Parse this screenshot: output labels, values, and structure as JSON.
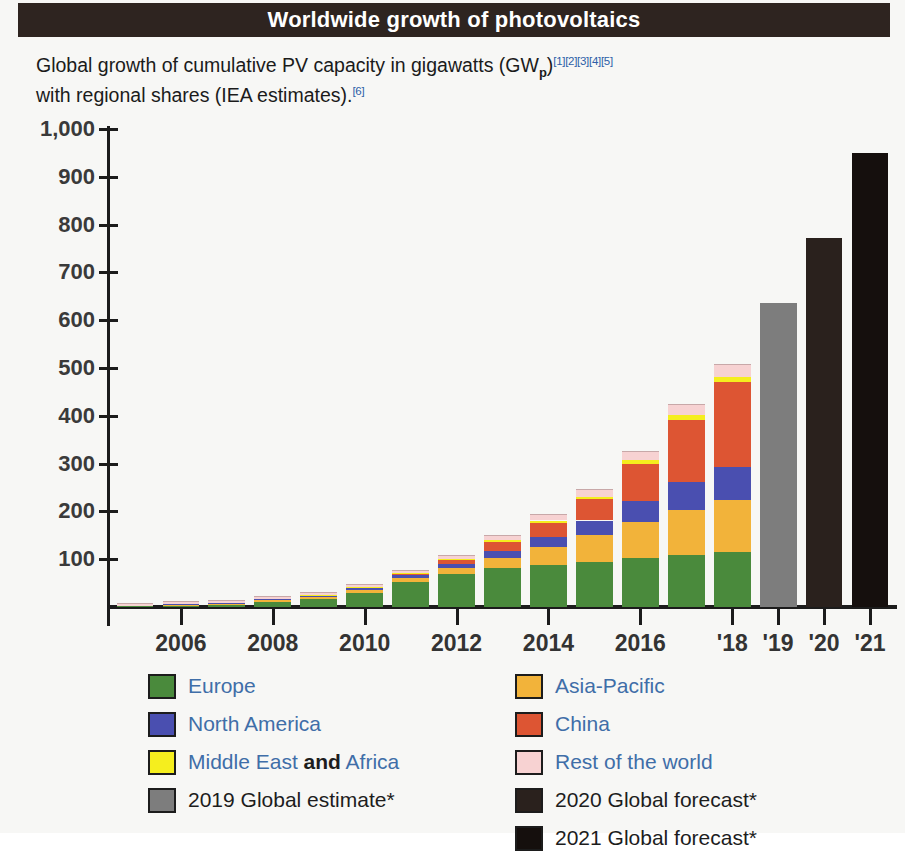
{
  "header": {
    "title": "Worldwide growth of photovoltaics"
  },
  "caption": {
    "line1_pre": "Global growth of cumulative PV capacity in gigawatts (GW",
    "line1_sub": "p",
    "line1_post": ")",
    "refs1": "[1][2][3][4][5]",
    "line2": "with regional shares (IEA estimates).",
    "refs2": "[6]"
  },
  "colors": {
    "europe": "#4a8a3c",
    "asia_pacific": "#f2b33a",
    "north_america": "#4a4fb0",
    "china": "#dd5533",
    "middle_east_africa": "#f5ee1e",
    "rest_of_world": "#f7d2d2",
    "estimate_2019": "#7d7d7d",
    "forecast_2020": "#2a211d",
    "forecast_2021": "#150f0d",
    "axis": "#1c1c1c",
    "title_bar": "#2e2420",
    "legend_text": "#3f6ea8",
    "reference_link": "#2d5fa8"
  },
  "legend": {
    "left": [
      {
        "label": "Europe",
        "color_key": "europe",
        "icon": "color-swatch",
        "dark": false
      },
      {
        "label": "North America",
        "color_key": "north_america",
        "icon": "color-swatch",
        "dark": false
      },
      {
        "label": "Middle East and Africa",
        "color_key": "middle_east_africa",
        "icon": "color-swatch",
        "dark": false,
        "mixed": true,
        "parts": [
          "Middle East ",
          "and",
          " Africa"
        ]
      },
      {
        "label": "2019 Global estimate*",
        "color_key": "estimate_2019",
        "icon": "color-swatch",
        "dark": true
      }
    ],
    "right": [
      {
        "label": "Asia-Pacific",
        "color_key": "asia_pacific",
        "icon": "color-swatch",
        "dark": false
      },
      {
        "label": "China",
        "color_key": "china",
        "icon": "color-swatch",
        "dark": false
      },
      {
        "label": "Rest of the world",
        "color_key": "rest_of_world",
        "icon": "color-swatch",
        "dark": false
      },
      {
        "label": "2020 Global forecast*",
        "color_key": "forecast_2020",
        "icon": "color-swatch",
        "dark": true
      },
      {
        "label": "2021 Global forecast*",
        "color_key": "forecast_2021",
        "icon": "color-swatch",
        "dark": true
      }
    ]
  },
  "chart_data": {
    "type": "bar",
    "stacked": true,
    "title": "Worldwide growth of photovoltaics",
    "subtitle": "Global growth of cumulative PV capacity in gigawatts (GWp) with regional shares (IEA estimates).",
    "xlabel": "",
    "ylabel": "",
    "ylim": [
      0,
      1000
    ],
    "yticks": [
      0,
      100,
      200,
      300,
      400,
      500,
      600,
      700,
      800,
      900,
      1000
    ],
    "ytick_labels": [
      "",
      "100",
      "200",
      "300",
      "400",
      "500",
      "600",
      "700",
      "800",
      "900",
      "1,000"
    ],
    "grid": false,
    "legend_position": "bottom",
    "categories": [
      "2005",
      "2006",
      "2007",
      "2008",
      "2009",
      "2010",
      "2011",
      "2012",
      "2013",
      "2014",
      "2015",
      "2016",
      "2017",
      "2018",
      "2019",
      "2020",
      "2021"
    ],
    "xtick_labels": [
      "2006",
      "2008",
      "2010",
      "2012",
      "2014",
      "2016",
      "'18",
      "'19",
      "'20",
      "'21"
    ],
    "xtick_categories": [
      "2006",
      "2008",
      "2010",
      "2012",
      "2014",
      "2016",
      "2018",
      "2019",
      "2020",
      "2021"
    ],
    "series": [
      {
        "name": "Europe",
        "color_key": "europe",
        "values": [
          2,
          3,
          5,
          11,
          16,
          30,
          52,
          70,
          81,
          88,
          95,
          102,
          108,
          115,
          0,
          0,
          0
        ]
      },
      {
        "name": "Asia-Pacific",
        "color_key": "asia_pacific",
        "values": [
          1,
          2,
          2,
          3,
          4,
          5,
          8,
          12,
          22,
          38,
          55,
          75,
          95,
          108,
          0,
          0,
          0
        ]
      },
      {
        "name": "North America",
        "color_key": "north_america",
        "values": [
          0,
          1,
          1,
          2,
          3,
          4,
          6,
          9,
          14,
          21,
          31,
          45,
          58,
          70,
          0,
          0,
          0
        ]
      },
      {
        "name": "China",
        "color_key": "china",
        "values": [
          0,
          0,
          0,
          0,
          1,
          1,
          3,
          7,
          19,
          29,
          44,
          78,
          130,
          177,
          0,
          0,
          0
        ]
      },
      {
        "name": "Middle East and Africa",
        "color_key": "middle_east_africa",
        "values": [
          0,
          0,
          0,
          1,
          1,
          2,
          2,
          3,
          4,
          5,
          6,
          8,
          10,
          12,
          0,
          0,
          0
        ]
      },
      {
        "name": "Rest of the world",
        "color_key": "rest_of_world",
        "values": [
          1,
          1,
          1,
          2,
          3,
          4,
          5,
          6,
          8,
          11,
          14,
          17,
          21,
          24,
          0,
          0,
          0
        ]
      },
      {
        "name": "2019 Global estimate*",
        "color_key": "estimate_2019",
        "values": [
          0,
          0,
          0,
          0,
          0,
          0,
          0,
          0,
          0,
          0,
          0,
          0,
          0,
          0,
          635,
          0,
          0
        ]
      },
      {
        "name": "2020 Global forecast*",
        "color_key": "forecast_2020",
        "values": [
          0,
          0,
          0,
          0,
          0,
          0,
          0,
          0,
          0,
          0,
          0,
          0,
          0,
          0,
          0,
          772,
          0
        ]
      },
      {
        "name": "2021 Global forecast*",
        "color_key": "forecast_2021",
        "values": [
          0,
          0,
          0,
          0,
          0,
          0,
          0,
          0,
          0,
          0,
          0,
          0,
          0,
          0,
          0,
          0,
          950
        ]
      }
    ],
    "totals": [
      4,
      7,
      9,
      19,
      28,
      46,
      76,
      107,
      148,
      192,
      245,
      325,
      422,
      506,
      635,
      772,
      950
    ]
  }
}
